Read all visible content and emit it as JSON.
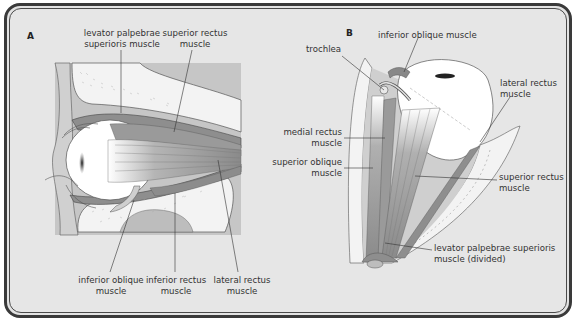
{
  "figure": {
    "panels": [
      {
        "letter": "A",
        "view": "lateral",
        "labels": {
          "levator_palpebrae_superioris": [
            "levator palpebrae",
            "superioris muscle"
          ],
          "superior_rectus": [
            "superior rectus",
            "muscle"
          ],
          "inferior_oblique": [
            "inferior oblique",
            "muscle"
          ],
          "inferior_rectus": [
            "inferior rectus",
            "muscle"
          ],
          "lateral_rectus": [
            "lateral rectus",
            "muscle"
          ]
        }
      },
      {
        "letter": "B",
        "view": "superior",
        "labels": {
          "trochlea": [
            "trochlea"
          ],
          "inferior_oblique": [
            "inferior oblique muscle"
          ],
          "lateral_rectus": [
            "lateral rectus",
            "muscle"
          ],
          "medial_rectus": [
            "medial rectus",
            "muscle"
          ],
          "superior_oblique": [
            "superior oblique",
            "muscle"
          ],
          "superior_rectus": [
            "superior rectus",
            "muscle"
          ],
          "levator_divided": [
            "levator palpebrae superioris",
            "muscle (divided)"
          ]
        }
      }
    ],
    "colors": {
      "background": "#e6e6e6",
      "frame": "#3a3a3a",
      "muscle": "#8f8f8f",
      "bone": "#f2f2f2",
      "tissue": "#c4c4c4",
      "eyeball": "#ffffff"
    }
  }
}
